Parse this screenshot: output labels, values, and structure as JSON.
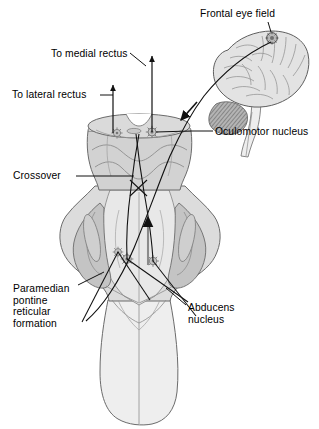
{
  "figure": {
    "view": "dorsal view of brainstem with lateral view of cerebral hemisphere",
    "background_color": "#ffffff"
  },
  "labels": {
    "frontal_eye_field": "Frontal eye field",
    "to_medial_rectus": "To medial rectus",
    "to_lateral_rectus": "To lateral rectus",
    "oculomotor_nucleus": "Oculomotor nucleus",
    "crossover": "Crossover",
    "paramedian_pontine_reticular_formation": "Paramedian\npontine\nreticular\nformation",
    "abducens_nucleus": "Abducens\nnucleus"
  },
  "colors": {
    "outline": "#6b6b6b",
    "outline_dark": "#4a4a4a",
    "midbrain_fill": "#d2d2d2",
    "pons_fill": "#dcdcdc",
    "peduncle_fill": "#c4c4c4",
    "medulla_fill": "#eeeeee",
    "tegmentum_fill": "#e8e8e8",
    "brain_fill": "#e3e3e3",
    "cerebellum_fill": "#9a9a9a",
    "tract_line": "#1a1a1a",
    "nucleus_marker": "#8a8a8a",
    "text": "#000000"
  },
  "structures": [
    {
      "name": "cerebral-hemisphere",
      "kind": "lateral-brain-outline"
    },
    {
      "name": "cerebellum",
      "kind": "hatched-lobe"
    },
    {
      "name": "brainstem-dorsal",
      "kind": "midbrain-pons-medulla"
    },
    {
      "name": "midbrain-cut-surface",
      "kind": "transverse-cut-ellipse"
    },
    {
      "name": "superior-cerebellar-peduncle",
      "kind": "lateral-column"
    },
    {
      "name": "fourth-ventricle-floor",
      "kind": "rhomboid-fossa"
    }
  ],
  "markers": [
    {
      "name": "oculomotor-nucleus-right",
      "x": 152,
      "y": 132
    },
    {
      "name": "oculomotor-nucleus-left",
      "x": 117,
      "y": 133
    },
    {
      "name": "abducens-nucleus-right",
      "x": 127,
      "y": 259
    },
    {
      "name": "abducens-nucleus-left",
      "x": 152,
      "y": 261
    },
    {
      "name": "pprf-marker",
      "x": 117,
      "y": 252
    }
  ],
  "pathways": [
    {
      "name": "corticobulbar-descending-tract",
      "has_arrowhead": true,
      "direction": "down-left"
    },
    {
      "name": "to-medial-rectus-arrow",
      "has_arrowhead": true,
      "direction": "up"
    },
    {
      "name": "to-lateral-rectus-arrow",
      "has_arrowhead": true,
      "direction": "up"
    },
    {
      "name": "mlf-ascending-arrow",
      "has_arrowhead": true,
      "direction": "up"
    },
    {
      "name": "crossover-decussation",
      "has_arrowhead": false
    }
  ]
}
